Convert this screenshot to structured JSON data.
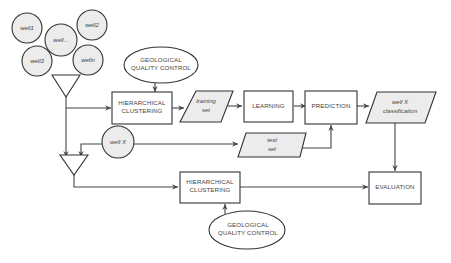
{
  "diagram": {
    "type": "flowchart",
    "colors": {
      "stroke": "#333333",
      "shaded_fill": "#ececec",
      "text": "#444444",
      "background": "#ffffff"
    },
    "wells": [
      {
        "id": "well1",
        "label": "well1"
      },
      {
        "id": "well-dots",
        "label": "well..."
      },
      {
        "id": "well2",
        "label": "well2"
      },
      {
        "id": "well3",
        "label": "well3"
      },
      {
        "id": "welln",
        "label": "welln"
      }
    ],
    "well_x": {
      "label": "well X"
    },
    "top_qc": {
      "line1": "GEOLOGICAL",
      "line2": "QUALITY CONTROL"
    },
    "bottom_qc": {
      "line1": "GEOLOGICAL",
      "line2": "QUALITY CONTROL"
    },
    "top_clustering": {
      "line1": "HIERARCHICAL",
      "line2": "CLUSTERING"
    },
    "bottom_clustering": {
      "line1": "HIERARCHICAL",
      "line2": "CLUSTERING"
    },
    "training_set": {
      "line1": "training",
      "line2": "set"
    },
    "test_set": {
      "line1": "test",
      "line2": "set"
    },
    "learning": {
      "label": "LEARNING"
    },
    "prediction": {
      "label": "PREDICTION"
    },
    "classification": {
      "line1": "well X",
      "line2": "classification"
    },
    "evaluation": {
      "label": "EVALUATION"
    },
    "edges": [
      {
        "from": "wells",
        "to": "merge-triangle-top"
      },
      {
        "from": "merge-triangle-top",
        "to": "top_clustering"
      },
      {
        "from": "merge-triangle-top",
        "to": "merge-triangle-bottom"
      },
      {
        "from": "top_qc",
        "to": "top_clustering"
      },
      {
        "from": "top_clustering",
        "to": "training_set"
      },
      {
        "from": "training_set",
        "to": "learning"
      },
      {
        "from": "learning",
        "to": "prediction"
      },
      {
        "from": "prediction",
        "to": "classification"
      },
      {
        "from": "well_x",
        "to": "test_set"
      },
      {
        "from": "well_x",
        "to": "merge-triangle-bottom"
      },
      {
        "from": "test_set",
        "to": "prediction"
      },
      {
        "from": "merge-triangle-bottom",
        "to": "bottom_clustering"
      },
      {
        "from": "bottom_qc",
        "to": "bottom_clustering"
      },
      {
        "from": "bottom_clustering",
        "to": "evaluation"
      },
      {
        "from": "classification",
        "to": "evaluation"
      }
    ]
  }
}
